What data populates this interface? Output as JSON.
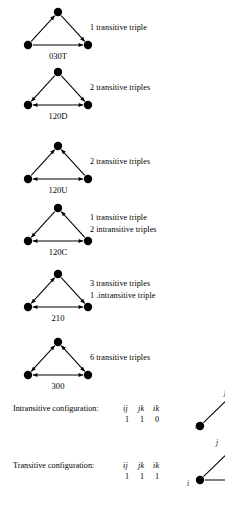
{
  "figure": {
    "background": "#ffffff",
    "ink": "#000000"
  },
  "triads": [
    {
      "code": "030T",
      "name": "triad-030T",
      "top": 4,
      "caption_top": 22,
      "lines": [
        "1 transitive triple"
      ],
      "edges": {
        "left": "up",
        "right": "down",
        "bottom": "right"
      }
    },
    {
      "code": "120D",
      "name": "triad-120D",
      "top": 64,
      "caption_top": 82,
      "lines": [
        "2 transitive triples"
      ],
      "edges": {
        "left": "down",
        "right": "down",
        "bottom": "both"
      }
    },
    {
      "code": "120U",
      "name": "triad-120U",
      "top": 138,
      "caption_top": 156,
      "lines": [
        "2 transitive triples"
      ],
      "edges": {
        "left": "up",
        "right": "up",
        "bottom": "both"
      }
    },
    {
      "code": "120C",
      "name": "triad-120C",
      "top": 200,
      "caption_top": 212,
      "lines": [
        "1 transitive triple",
        "2 intransitive  triples"
      ],
      "edges": {
        "left": "down",
        "right": "up",
        "bottom": "both"
      }
    },
    {
      "code": "210",
      "name": "triad-210",
      "top": 266,
      "caption_top": 278,
      "lines": [
        "3 transitive  triples",
        "1 .intransitive triple"
      ],
      "edges": {
        "left": "both",
        "right": "down",
        "bottom": "both"
      }
    },
    {
      "code": "300",
      "name": "triad-300",
      "top": 334,
      "caption_top": 352,
      "lines": [
        "6 transitive triples"
      ],
      "edges": {
        "left": "both",
        "right": "both",
        "bottom": "both"
      }
    }
  ],
  "configurations": [
    {
      "name": "intransitive-configuration",
      "top": 404,
      "label": "Intransitive configuration:",
      "headers": [
        "ij",
        "jk",
        "ik"
      ],
      "values": [
        "1",
        "1",
        "0"
      ]
    },
    {
      "name": "transitive-configuration",
      "top": 461,
      "label": "Transitive configuration:",
      "headers": [
        "ij",
        "jk",
        "ik"
      ],
      "values": [
        "1",
        "1",
        "1"
      ]
    }
  ],
  "side_figures": [
    {
      "name": "side-figure-intransitive",
      "left": 186,
      "top": 386,
      "labels": [
        {
          "text": "j",
          "left": 38,
          "top": 2
        },
        {
          "text": "i",
          "left": 9,
          "top": 36
        }
      ]
    },
    {
      "name": "side-figure-transitive",
      "left": 186,
      "top": 440,
      "labels": [
        {
          "text": "j",
          "left": 30,
          "top": -2
        },
        {
          "text": "i",
          "left": 1,
          "top": 39
        }
      ]
    }
  ]
}
